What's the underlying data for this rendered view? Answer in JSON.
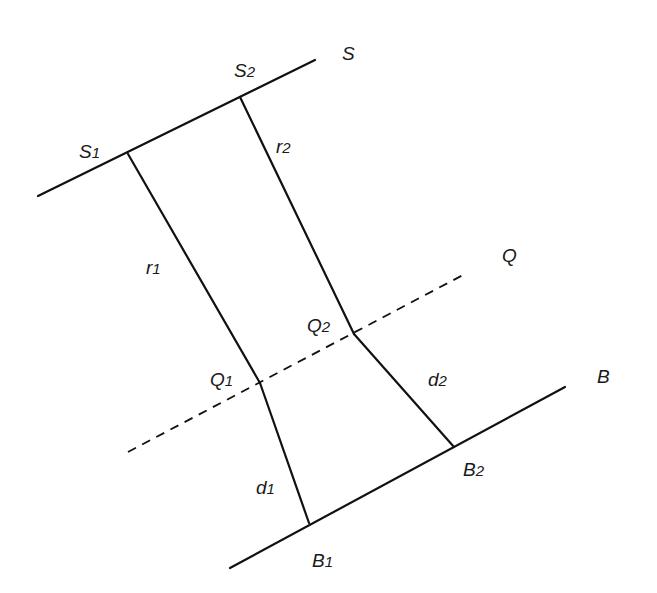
{
  "diagram": {
    "type": "ray-path geometry",
    "lines": {
      "S": {
        "label": "S",
        "style": "solid",
        "from": [
          38,
          196
        ],
        "to": [
          315,
          60
        ]
      },
      "Q": {
        "label": "Q",
        "style": "dashed",
        "from": [
          128,
          452
        ],
        "to": [
          463,
          275
        ]
      },
      "B": {
        "label": "B",
        "style": "solid",
        "from": [
          230,
          568
        ],
        "to": [
          565,
          387
        ]
      }
    },
    "points": {
      "S1": {
        "label": "S",
        "sub": "1",
        "x": 128,
        "y": 154
      },
      "S2": {
        "label": "S",
        "sub": "2",
        "x": 240,
        "y": 97
      },
      "Q1": {
        "label": "Q",
        "sub": "1",
        "x": 260,
        "y": 383
      },
      "Q2": {
        "label": "Q",
        "sub": "2",
        "x": 354,
        "y": 334
      },
      "B1": {
        "label": "B",
        "sub": "1",
        "x": 309,
        "y": 523
      },
      "B2": {
        "label": "B",
        "sub": "2",
        "x": 454,
        "y": 447
      }
    },
    "segments": [
      {
        "name": "r1",
        "label": "r",
        "sub": "1",
        "from": "S1",
        "to": "Q1"
      },
      {
        "name": "r2",
        "label": "r",
        "sub": "2",
        "from": "S2",
        "to": "Q2"
      },
      {
        "name": "d1",
        "label": "d",
        "sub": "1",
        "from": "Q1",
        "to": "B1"
      },
      {
        "name": "d2",
        "label": "d",
        "sub": "2",
        "from": "Q2",
        "to": "B2"
      }
    ],
    "labels": {
      "S": "S",
      "Q": "Q",
      "B": "B",
      "S1": {
        "main": "S",
        "sub": "1"
      },
      "S2": {
        "main": "S",
        "sub": "2"
      },
      "Q1": {
        "main": "Q",
        "sub": "1"
      },
      "Q2": {
        "main": "Q",
        "sub": "2"
      },
      "B1": {
        "main": "B",
        "sub": "1"
      },
      "B2": {
        "main": "B",
        "sub": "2"
      },
      "r1": {
        "main": "r",
        "sub": "1"
      },
      "r2": {
        "main": "r",
        "sub": "2"
      },
      "d1": {
        "main": "d",
        "sub": "1"
      },
      "d2": {
        "main": "d",
        "sub": "2"
      }
    }
  }
}
